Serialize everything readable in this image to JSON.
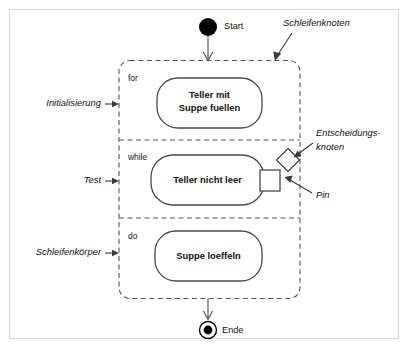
{
  "diagram": {
    "type": "uml-activity-diagram",
    "title_visible": false,
    "language": "de",
    "colors": {
      "frame_border": "#d9d9d9",
      "dashed_container": "#555555",
      "node_outline": "#4a4a4a",
      "node_fill": "#ffffff",
      "ink": "#111111",
      "flow_line": "#5a5a5a"
    }
  },
  "nodes": {
    "start": {
      "label": "Start",
      "shape": "filled-circle"
    },
    "end": {
      "label": "Ende",
      "shape": "final-node-circle-with-dot"
    }
  },
  "loop_node": {
    "name": "Schleifenknoten",
    "sections": [
      {
        "keyword": "for",
        "action_lines": [
          "Teller mit",
          "Suppe fuellen"
        ],
        "annotation": "Initialisierung"
      },
      {
        "keyword": "while",
        "action_lines": [
          "Teller nicht leer"
        ],
        "annotation": "Test",
        "has_pin": true,
        "has_decision": true
      },
      {
        "keyword": "do",
        "action_lines": [
          "Suppe loeffeln"
        ],
        "annotation": "Schleifenkörper"
      }
    ]
  },
  "annotations": [
    {
      "id": "schleifenknoten",
      "text": "Schleifenknoten",
      "style": "italic",
      "position": "top-right"
    },
    {
      "id": "initialisierung",
      "text": "Initialisierung",
      "style": "italic",
      "position": "left"
    },
    {
      "id": "test",
      "text": "Test",
      "style": "italic",
      "position": "left"
    },
    {
      "id": "schleifenkoerper",
      "text": "Schleifenkörper",
      "style": "italic",
      "position": "left"
    },
    {
      "id": "entscheidungsknoten",
      "text_line1": "Entscheidungs-",
      "text_line2": "knoten",
      "style": "italic",
      "position": "right"
    },
    {
      "id": "pin",
      "text": "Pin",
      "style": "italic",
      "position": "right"
    }
  ]
}
